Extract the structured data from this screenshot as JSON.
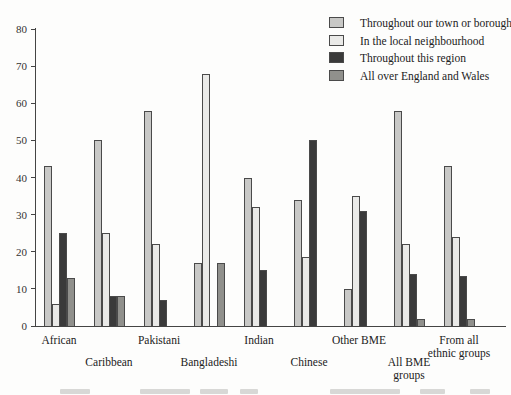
{
  "chart_data": {
    "type": "bar",
    "categories": [
      "African",
      "Caribbean",
      "Pakistani",
      "Bangladeshi",
      "Indian",
      "Chinese",
      "Other BME",
      "All BME\ngroups",
      "From all\nethnic groups"
    ],
    "category_label_rows": [
      1,
      2,
      1,
      2,
      1,
      2,
      1,
      2,
      1
    ],
    "series": [
      {
        "name": "Throughout our town or borough",
        "color": "#c8c8c6",
        "values": [
          43,
          50,
          58,
          17,
          40,
          34,
          10,
          58,
          43
        ]
      },
      {
        "name": "In the local neighbourhood",
        "color": "#eaeae8",
        "values": [
          6,
          25,
          22,
          68,
          32,
          18.5,
          35,
          22,
          24
        ]
      },
      {
        "name": "Throughout this region",
        "color": "#3a3a3a",
        "values": [
          25,
          8,
          7,
          0,
          15,
          50,
          31,
          14,
          13.5
        ]
      },
      {
        "name": "All over England and Wales",
        "color": "#90908c",
        "values": [
          13,
          8,
          0,
          17,
          0,
          0,
          0,
          2,
          2
        ]
      }
    ],
    "title": "",
    "xlabel": "",
    "ylabel": "",
    "ylim": [
      0,
      80
    ],
    "y_ticks": [
      0,
      10,
      20,
      30,
      40,
      50,
      60,
      70,
      80
    ],
    "grid": false,
    "legend_position": "top-right"
  },
  "legend": {
    "items": [
      "Throughout our town or borough",
      "In the local neighbourhood",
      "Throughout this region",
      "All over England and Wales"
    ]
  },
  "colors": {
    "axis": "#444444",
    "background": "#fdfdfc",
    "bar_outline": "#4a4a4a"
  }
}
